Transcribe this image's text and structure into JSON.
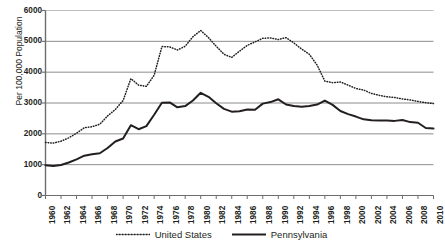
{
  "chart_data": {
    "type": "line",
    "title": "",
    "xlabel": "",
    "ylabel": "Per 100,000 Population",
    "xlim": [
      1960,
      2010
    ],
    "ylim": [
      0,
      6000
    ],
    "ytick_step": 1000,
    "xtick_step": 2,
    "grid": true,
    "legend_position": "bottom",
    "yticks": [
      "6000",
      "5000",
      "4000",
      "3000",
      "2000",
      "1000",
      "0"
    ],
    "xticks": [
      "1960",
      "1962",
      "1964",
      "1966",
      "1968",
      "1970",
      "1972",
      "1974",
      "1976",
      "1978",
      "1980",
      "1982",
      "1984",
      "1986",
      "1988",
      "1990",
      "1992",
      "1994",
      "1996",
      "1998",
      "2000",
      "2002",
      "2004",
      "2006",
      "2008",
      "2010"
    ],
    "x": [
      1960,
      1961,
      1962,
      1963,
      1964,
      1965,
      1966,
      1967,
      1968,
      1969,
      1970,
      1971,
      1972,
      1973,
      1974,
      1975,
      1976,
      1977,
      1978,
      1979,
      1980,
      1981,
      1982,
      1983,
      1984,
      1985,
      1986,
      1987,
      1988,
      1989,
      1990,
      1991,
      1992,
      1993,
      1994,
      1995,
      1996,
      1997,
      1998,
      1999,
      2000,
      2001,
      2002,
      2003,
      2004,
      2005,
      2006,
      2007,
      2008,
      2009,
      2010
    ],
    "series": [
      {
        "name": "United States",
        "style": "dotted",
        "color": "#231f20",
        "values": [
          1720,
          1700,
          1760,
          1870,
          2020,
          2200,
          2230,
          2310,
          2580,
          2790,
          3080,
          3790,
          3580,
          3540,
          3900,
          4830,
          4820,
          4720,
          4840,
          5150,
          5350,
          5120,
          4840,
          4580,
          4480,
          4680,
          4870,
          4980,
          5100,
          5110,
          5060,
          5120,
          4950,
          4750,
          4580,
          4230,
          3710,
          3660,
          3680,
          3580,
          3470,
          3420,
          3310,
          3250,
          3200,
          3180,
          3130,
          3100,
          3050,
          3010,
          2980
        ]
      },
      {
        "name": "Pennsylvania",
        "style": "solid",
        "color": "#231f20",
        "values": [
          980,
          960,
          990,
          1070,
          1170,
          1290,
          1340,
          1370,
          1540,
          1750,
          1850,
          2280,
          2150,
          2250,
          2620,
          3010,
          3020,
          2860,
          2900,
          3080,
          3330,
          3200,
          2990,
          2810,
          2720,
          2730,
          2790,
          2780,
          2980,
          3030,
          3120,
          2950,
          2900,
          2880,
          2900,
          2950,
          3080,
          2940,
          2740,
          2640,
          2560,
          2470,
          2440,
          2430,
          2430,
          2420,
          2450,
          2380,
          2360,
          2190,
          2170
        ]
      }
    ]
  },
  "legend": {
    "items": [
      {
        "label": "United States",
        "icon": "dotted-line-swatch"
      },
      {
        "label": "Pennsylvania",
        "icon": "solid-line-swatch"
      }
    ]
  }
}
